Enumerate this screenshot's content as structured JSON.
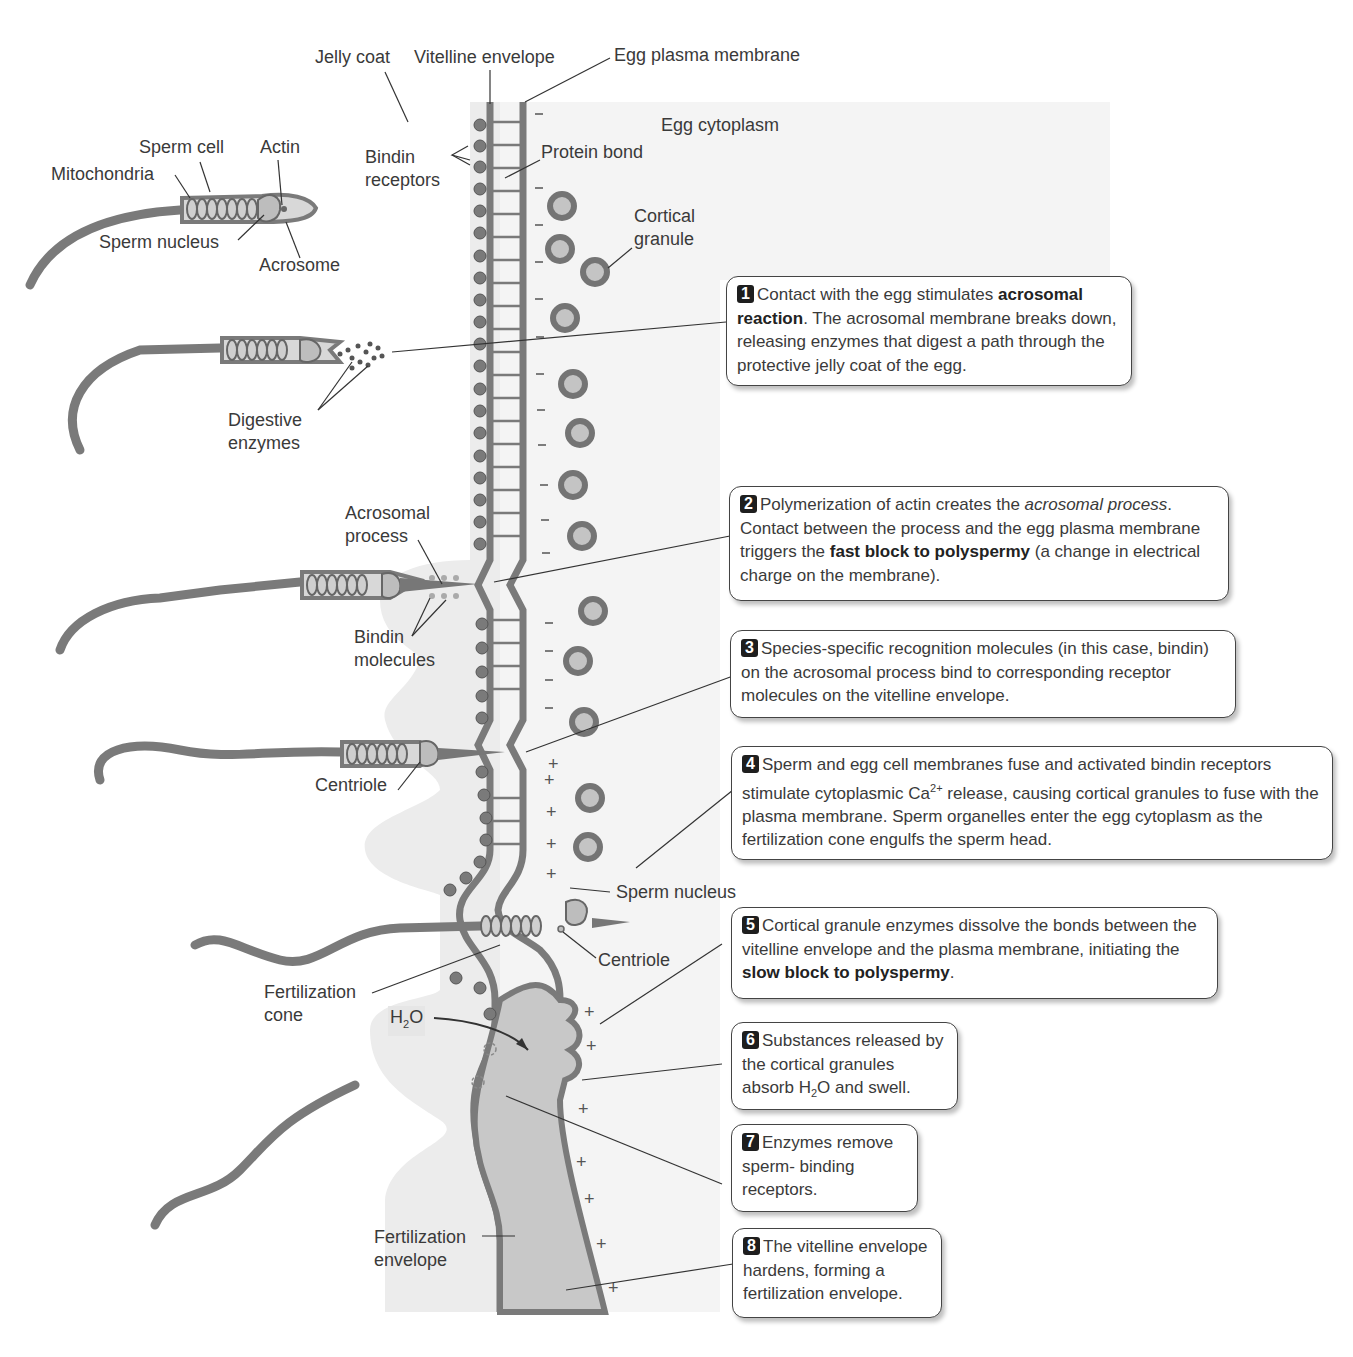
{
  "labels": {
    "jelly_coat": "Jelly coat",
    "vitelline_envelope": "Vitelline envelope",
    "egg_plasma_membrane": "Egg plasma membrane",
    "egg_cytoplasm": "Egg cytoplasm",
    "bindin_receptors_1": "Bindin",
    "bindin_receptors_2": "receptors",
    "protein_bond": "Protein bond",
    "cortical_granule_1": "Cortical",
    "cortical_granule_2": "granule",
    "sperm_cell": "Sperm cell",
    "actin": "Actin",
    "mitochondria": "Mitochondria",
    "sperm_nucleus_top": "Sperm nucleus",
    "acrosome": "Acrosome",
    "digestive_enzymes_1": "Digestive",
    "digestive_enzymes_2": "enzymes",
    "acrosomal_process_1": "Acrosomal",
    "acrosomal_process_2": "process",
    "bindin_molecules_1": "Bindin",
    "bindin_molecules_2": "molecules",
    "centriole_left": "Centriole",
    "sperm_nucleus_bottom": "Sperm nucleus",
    "centriole_right": "Centriole",
    "fertilization_cone_1": "Fertilization",
    "fertilization_cone_2": "cone",
    "h2o_h": "H",
    "h2o_sub": "2",
    "h2o_o": "O",
    "fertilization_envelope_1": "Fertilization",
    "fertilization_envelope_2": "envelope"
  },
  "steps": [
    {
      "num": "1",
      "pre": "Contact with the egg stimulates ",
      "bold": "acrosomal reaction",
      "post": ". The acrosomal membrane breaks down, releasing enzymes that digest a path through the protective jelly coat of the egg."
    },
    {
      "num": "2",
      "pre": "Polymerization of actin creates the ",
      "italic": "acrosomal process",
      "mid": ". Contact between the process and the egg plasma membrane triggers the ",
      "bold": "fast block to polyspermy",
      "post": " (a change in electrical charge on the membrane)."
    },
    {
      "num": "3",
      "text": "Species-specific recognition molecules (in this case, bindin) on the acrosomal process bind to corresponding receptor molecules on the vitelline envelope."
    },
    {
      "num": "4",
      "pre": "Sperm and egg cell membranes fuse and activated bindin receptors stimulate cytoplasmic Ca",
      "sup": "2+",
      "post": " release, causing cortical granules to fuse with the plasma membrane. Sperm organelles enter the egg cytoplasm as the fertilization cone engulfs the sperm head."
    },
    {
      "num": "5",
      "pre": "Cortical granule enzymes dissolve the bonds between the vitelline envelope and the plasma membrane, initiating the ",
      "bold": "slow block to polyspermy",
      "post": "."
    },
    {
      "num": "6",
      "pre": "Substances released by the cortical granules absorb H",
      "sub": "2",
      "post": "O and swell."
    },
    {
      "num": "7",
      "text": "Enzymes remove sperm- binding receptors."
    },
    {
      "num": "8",
      "text": "The vitelline envelope hardens, forming a fertilization envelope."
    }
  ],
  "charges": {
    "negative": "−",
    "positive": "+"
  },
  "colors": {
    "membrane": "#7a7a7a",
    "jelly": "#ececec",
    "cytoplasm": "#f3f3f3",
    "envelope_fill": "#c8c8c8",
    "granule_ring": "#747474",
    "granule_core": "#c4c4c4",
    "callout_badge": "#1e1e1e"
  }
}
